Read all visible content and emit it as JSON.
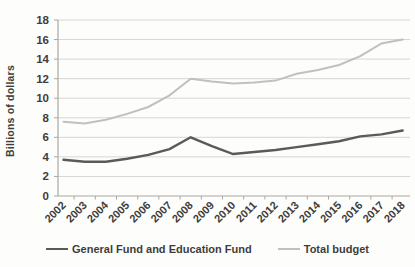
{
  "chart_data": {
    "type": "line",
    "title": "",
    "xlabel": "",
    "ylabel": "Billions of dollars",
    "x": [
      2002,
      2003,
      2004,
      2005,
      2006,
      2007,
      2008,
      2009,
      2010,
      2011,
      2012,
      2013,
      2014,
      2015,
      2016,
      2017,
      2018
    ],
    "series": [
      {
        "name": "General Fund and Education Fund",
        "color": "#5a5a5a",
        "line_width": 2.4,
        "values": [
          3.7,
          3.5,
          3.5,
          3.8,
          4.2,
          4.8,
          6.0,
          5.1,
          4.3,
          4.5,
          4.7,
          5.0,
          5.3,
          5.6,
          6.1,
          6.3,
          6.7
        ]
      },
      {
        "name": "Total budget",
        "color": "#c2c0bd",
        "line_width": 2.0,
        "values": [
          7.6,
          7.4,
          7.8,
          8.4,
          9.1,
          10.3,
          12.0,
          11.7,
          11.5,
          11.6,
          11.8,
          12.5,
          12.9,
          13.4,
          14.3,
          15.6,
          16.0
        ]
      }
    ],
    "ylim": [
      0,
      18
    ],
    "ytick_step": 2,
    "grid": true,
    "legend_position": "bottom",
    "colors": {
      "grid_line": "#d8d6d2",
      "axis_line": "#aaa8a4",
      "tick_text": "#3e3d3b"
    }
  }
}
